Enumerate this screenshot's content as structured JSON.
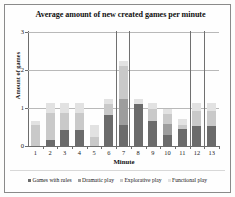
{
  "figure": {
    "width": 235,
    "height": 197,
    "background": "#fdfdfc",
    "border_color": "#8a8a8a"
  },
  "chart_data": {
    "type": "bar",
    "subtype": "stacked",
    "title": "Average amount of  new created games per minute",
    "xlabel": "Minute",
    "ylabel": "Amount of games",
    "categories": [
      "1",
      "2",
      "3",
      "4",
      "5",
      "6",
      "7",
      "8",
      "9",
      "10",
      "11",
      "12",
      "13"
    ],
    "ylim": [
      0,
      3
    ],
    "yticks": [
      0,
      1,
      2,
      3
    ],
    "ytick_labels": [
      "0",
      "1",
      "2",
      "3"
    ],
    "grid": true,
    "grid_axis": "y",
    "legend_position": "bottom",
    "series": [
      {
        "name": "Functional play",
        "color": "#e2e2e2",
        "values": [
          0.1,
          0.25,
          0.25,
          0.25,
          0.3,
          0.15,
          0.15,
          0.15,
          0.15,
          0.15,
          0.15,
          0.2,
          0.2
        ]
      },
      {
        "name": "Explorative play",
        "color": "#c9c9c9",
        "values": [
          0.55,
          0.7,
          0.45,
          0.45,
          0.25,
          0.28,
          0.85,
          0.0,
          0.3,
          0.25,
          0.1,
          0.4,
          0.4
        ]
      },
      {
        "name": "Dramatic play",
        "color": "#9d9d9d",
        "values": [
          0.0,
          0.0,
          0.0,
          0.0,
          0.0,
          0.0,
          0.7,
          0.0,
          0.0,
          0.3,
          0.0,
          0.0,
          0.0
        ]
      },
      {
        "name": "Games with rules",
        "color": "#6b6b6b",
        "values": [
          0.0,
          0.17,
          0.42,
          0.42,
          0.0,
          0.82,
          0.55,
          1.1,
          0.67,
          0.28,
          0.45,
          0.52,
          0.52
        ]
      }
    ],
    "totals": [
      0.65,
      1.12,
      1.12,
      1.12,
      0.55,
      1.25,
      2.25,
      1.25,
      1.12,
      0.98,
      0.7,
      1.12,
      1.12
    ],
    "dividers_after_minute": [
      6,
      6.9,
      11,
      12
    ]
  },
  "legend": {
    "items": [
      {
        "label": "Games with rules",
        "color": "#6b6b6b"
      },
      {
        "label": "Dramatic play",
        "color": "#9d9d9d"
      },
      {
        "label": "Explorative play",
        "color": "#c9c9c9"
      },
      {
        "label": "Functional play",
        "color": "#e2e2e2"
      }
    ]
  }
}
